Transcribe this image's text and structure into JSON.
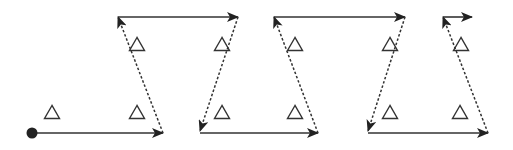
{
  "diagram": {
    "title": "",
    "width": 513,
    "height": 150,
    "colors": {
      "line": "#333333",
      "marker": "#222222",
      "triangle_stroke": "#333333",
      "background": "#ffffff"
    },
    "start_point": {
      "x": 32,
      "y": 133,
      "r": 5.5
    },
    "solid_arrows": [
      {
        "x1": 32,
        "y1": 133,
        "x2": 163,
        "y2": 133
      },
      {
        "x1": 118,
        "y1": 17,
        "x2": 238,
        "y2": 17
      },
      {
        "x1": 200,
        "y1": 133,
        "x2": 318,
        "y2": 133
      },
      {
        "x1": 274,
        "y1": 17,
        "x2": 405,
        "y2": 17
      },
      {
        "x1": 368,
        "y1": 133,
        "x2": 488,
        "y2": 133
      },
      {
        "x1": 443,
        "y1": 17,
        "x2": 472,
        "y2": 17
      }
    ],
    "dashed_arrows": [
      {
        "x1": 163,
        "y1": 133,
        "x2": 118,
        "y2": 17
      },
      {
        "x1": 238,
        "y1": 17,
        "x2": 200,
        "y2": 131
      },
      {
        "x1": 318,
        "y1": 133,
        "x2": 274,
        "y2": 17
      },
      {
        "x1": 405,
        "y1": 17,
        "x2": 368,
        "y2": 131
      },
      {
        "x1": 488,
        "y1": 133,
        "x2": 443,
        "y2": 17
      }
    ],
    "triangles": [
      {
        "x": 52,
        "y": 112
      },
      {
        "x": 137,
        "y": 112
      },
      {
        "x": 137,
        "y": 44
      },
      {
        "x": 222,
        "y": 44
      },
      {
        "x": 222,
        "y": 112
      },
      {
        "x": 295,
        "y": 44
      },
      {
        "x": 295,
        "y": 112
      },
      {
        "x": 390,
        "y": 44
      },
      {
        "x": 390,
        "y": 112
      },
      {
        "x": 461,
        "y": 44
      },
      {
        "x": 460,
        "y": 112
      }
    ],
    "triangle_size": 15
  }
}
